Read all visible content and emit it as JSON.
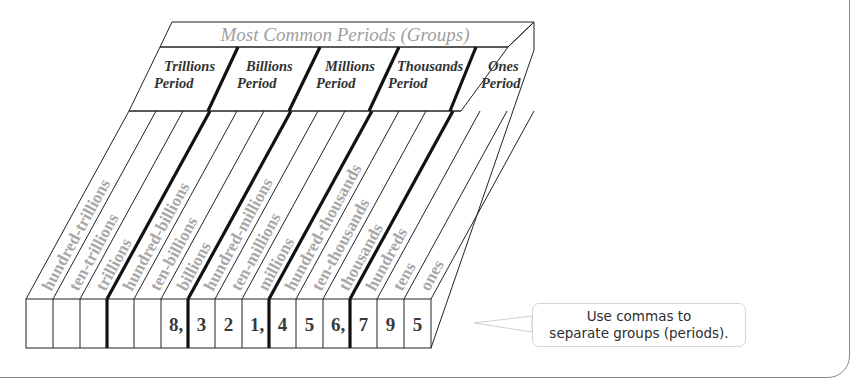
{
  "diagram": {
    "title": "Most Common Periods (Groups)",
    "periods": [
      {
        "line1": "Trillions",
        "line2": "Period"
      },
      {
        "line1": "Billions",
        "line2": "Period"
      },
      {
        "line1": "Millions",
        "line2": "Period"
      },
      {
        "line1": "Thousands",
        "line2": "Period"
      },
      {
        "line1": "Ones",
        "line2": "Period"
      }
    ],
    "place_values": [
      "hundred-trillions",
      "ten-trillions",
      "trillions",
      "hundred-billions",
      "ten-billions",
      "billions",
      "hundred-millions",
      "ten-millions",
      "millions",
      "hundred-thousands",
      "ten-thousands",
      "thousands",
      "hundreds",
      "tens",
      "ones"
    ],
    "digits": [
      "",
      "",
      "",
      "",
      "",
      "8,",
      "3",
      "2",
      "1,",
      "4",
      "5",
      "6,",
      "7",
      "9",
      "5"
    ],
    "number_shown": "8,321,456,795"
  },
  "callout": {
    "line1": "Use commas to",
    "line2": "separate groups (periods)."
  },
  "colors": {
    "line": "#222222",
    "label_text": "#9a9a9a",
    "title_text": "#a0a0a0",
    "digit_text": "#333333",
    "frame": "#8a8a8a"
  }
}
